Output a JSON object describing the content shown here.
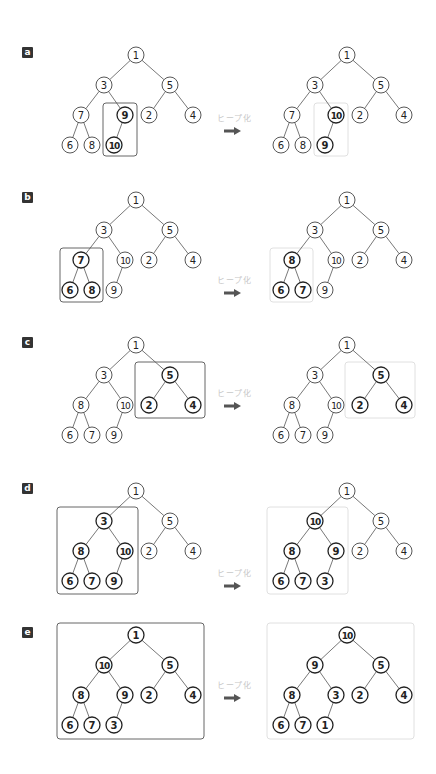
{
  "arrow_label": "ヒープ化",
  "colors": {
    "line": "#555555",
    "node_stroke": "#444444",
    "node_stroke_bold": "#222222",
    "box_left": "#555555",
    "box_right": "#dddddd",
    "label_bg": "#333333",
    "arrow": "#555555",
    "arrow_text": "#c8c8c8"
  },
  "panels": [
    {
      "label": "a",
      "root_y": 55,
      "left_tree": {
        "values": [
          "1",
          "3",
          "5",
          "7",
          "9",
          "2",
          "4",
          "6",
          "8",
          "10"
        ],
        "highlight": [
          4,
          9
        ]
      },
      "right_tree": {
        "values": [
          "1",
          "3",
          "5",
          "7",
          "10",
          "2",
          "4",
          "6",
          "8",
          "9"
        ],
        "highlight": [
          4,
          9
        ]
      },
      "left_box": {
        "x": 103,
        "y": 103,
        "w": 34,
        "h": 53
      },
      "right_box": {
        "x": 314,
        "y": 103,
        "w": 34,
        "h": 53
      },
      "arrow_text_y": 117,
      "arrow_y": 131
    },
    {
      "label": "b",
      "root_y": 200,
      "left_tree": {
        "values": [
          "1",
          "3",
          "5",
          "7",
          "10",
          "2",
          "4",
          "6",
          "8",
          "9"
        ],
        "highlight": [
          3,
          7,
          8
        ]
      },
      "right_tree": {
        "values": [
          "1",
          "3",
          "5",
          "8",
          "10",
          "2",
          "4",
          "6",
          "7",
          "9"
        ],
        "highlight": [
          3,
          7,
          8
        ]
      },
      "left_box": {
        "x": 60,
        "y": 248,
        "w": 43,
        "h": 54
      },
      "right_box": {
        "x": 270,
        "y": 248,
        "w": 43,
        "h": 54
      },
      "arrow_text_y": 279,
      "arrow_y": 293
    },
    {
      "label": "c",
      "root_y": 345,
      "left_tree": {
        "values": [
          "1",
          "3",
          "5",
          "8",
          "10",
          "2",
          "4",
          "6",
          "7",
          "9"
        ],
        "highlight": [
          2,
          5,
          6
        ]
      },
      "right_tree": {
        "values": [
          "1",
          "3",
          "5",
          "8",
          "10",
          "2",
          "4",
          "6",
          "7",
          "9"
        ],
        "highlight": [
          2,
          5,
          6
        ]
      },
      "left_box": {
        "x": 135,
        "y": 362,
        "w": 70,
        "h": 56
      },
      "right_box": {
        "x": 345,
        "y": 362,
        "w": 70,
        "h": 56
      },
      "arrow_text_y": 392,
      "arrow_y": 406
    },
    {
      "label": "d",
      "root_y": 491,
      "left_tree": {
        "values": [
          "1",
          "3",
          "5",
          "8",
          "10",
          "2",
          "4",
          "6",
          "7",
          "9"
        ],
        "highlight": [
          1,
          3,
          4,
          7,
          8,
          9
        ]
      },
      "right_tree": {
        "values": [
          "1",
          "10",
          "5",
          "8",
          "9",
          "2",
          "4",
          "6",
          "7",
          "3"
        ],
        "highlight": [
          1,
          3,
          4,
          7,
          8,
          9
        ]
      },
      "left_box": {
        "x": 57,
        "y": 507,
        "w": 81,
        "h": 87
      },
      "right_box": {
        "x": 267,
        "y": 507,
        "w": 81,
        "h": 87
      },
      "arrow_text_y": 572,
      "arrow_y": 586
    },
    {
      "label": "e",
      "root_y": 635,
      "left_tree": {
        "values": [
          "1",
          "10",
          "5",
          "8",
          "9",
          "2",
          "4",
          "6",
          "7",
          "3"
        ],
        "highlight": [
          0,
          1,
          2,
          3,
          4,
          5,
          6,
          7,
          8,
          9
        ]
      },
      "right_tree": {
        "values": [
          "10",
          "9",
          "5",
          "8",
          "3",
          "2",
          "4",
          "6",
          "7",
          "1"
        ],
        "highlight": [
          0,
          1,
          2,
          3,
          4,
          5,
          6,
          7,
          8,
          9
        ]
      },
      "left_box": {
        "x": 57,
        "y": 623,
        "w": 147,
        "h": 116
      },
      "right_box": {
        "x": 267,
        "y": 623,
        "w": 147,
        "h": 116
      },
      "arrow_text_y": 684,
      "arrow_y": 698
    }
  ]
}
